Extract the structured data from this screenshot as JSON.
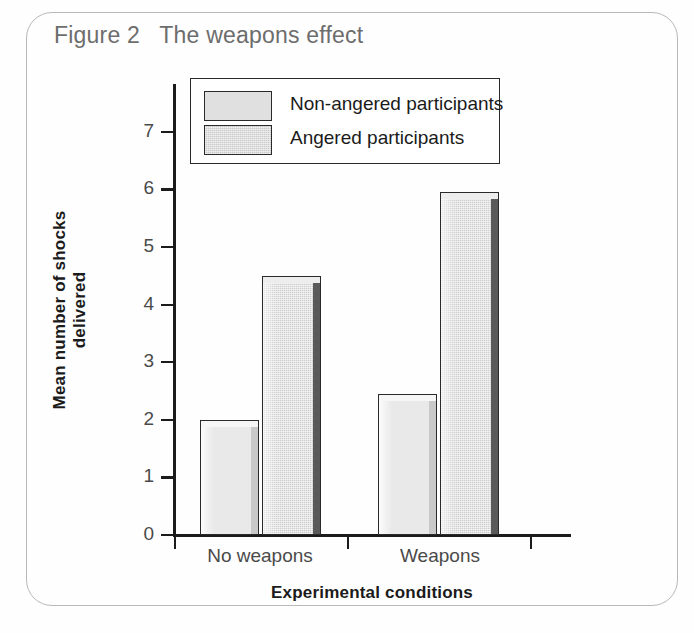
{
  "figure": {
    "title": "Figure 2   The weapons effect"
  },
  "legend": {
    "position": "inside-top-left",
    "entries": [
      {
        "label": "Non-angered participants",
        "swatch": "light-gray-bar-swatch",
        "color": "#e0e0e0"
      },
      {
        "label": "Angered participants",
        "swatch": "dark-gray-bar-swatch",
        "color": "#cacaca"
      }
    ]
  },
  "chart_data": {
    "type": "bar",
    "title": "Figure 2   The weapons effect",
    "xlabel": "Experimental conditions",
    "ylabel": "Mean number of shocks delivered",
    "categories": [
      "No weapons",
      "Weapons"
    ],
    "series": [
      {
        "name": "Non-angered participants",
        "values": [
          2.0,
          2.45
        ],
        "color": "#e9e9e9"
      },
      {
        "name": "Angered participants",
        "values": [
          4.5,
          5.95
        ],
        "color": "#cfcfcf"
      }
    ],
    "ylim": [
      0,
      7.4
    ],
    "yticks": [
      "0",
      "1",
      "2",
      "3",
      "4",
      "5",
      "6",
      "7"
    ],
    "grid": false,
    "legend_position": "inside-top-left",
    "style": "3d-bevelled-bars"
  }
}
